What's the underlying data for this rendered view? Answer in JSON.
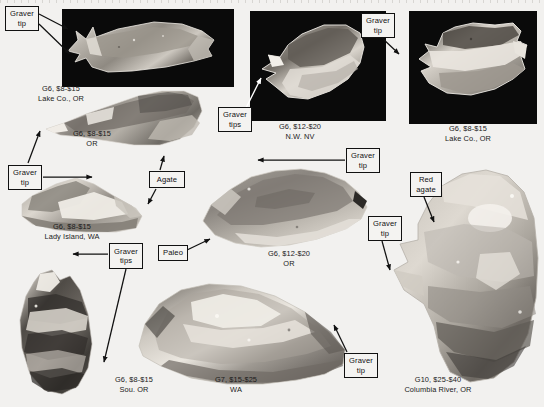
{
  "page": {
    "background": "#f2f1ef",
    "ink": "#111111",
    "plate_background": "#0a0a0a"
  },
  "specimens": [
    {
      "id": "lake-co-or-top",
      "caption": "G6, $8-$15\nLake Co., OR",
      "grade": "G6",
      "price": "$8-$15",
      "locality": "Lake Co., OR"
    },
    {
      "id": "or-second",
      "caption": "G6, $8-$15\nOR",
      "grade": "G6",
      "price": "$8-$15",
      "locality": "OR"
    },
    {
      "id": "nw-nv",
      "caption": "G6, $12-$20\nN.W. NV",
      "grade": "G6",
      "price": "$12-$20",
      "locality": "N.W. NV"
    },
    {
      "id": "lake-co-or-right",
      "caption": "G6, $8-$15\nLake Co., OR",
      "grade": "G6",
      "price": "$8-$15",
      "locality": "Lake Co., OR"
    },
    {
      "id": "lady-island-wa",
      "caption": "G6, $8-$15\nLady Island, WA",
      "grade": "G6",
      "price": "$8-$15",
      "locality": "Lady Island, WA"
    },
    {
      "id": "or-center",
      "caption": "G6, $12-$20\nOR",
      "grade": "G6",
      "price": "$12-$20",
      "locality": "OR"
    },
    {
      "id": "sou-or",
      "caption": "G6, $8-$15\nSou. OR",
      "grade": "G6",
      "price": "$8-$15",
      "locality": "Sou. OR"
    },
    {
      "id": "wa-bottom",
      "caption": "G7, $15-$25\nWA",
      "grade": "G7",
      "price": "$15-$25",
      "locality": "WA"
    },
    {
      "id": "columbia-river-or",
      "caption": "G10, $25-$40\nColumbia River, OR",
      "grade": "G10",
      "price": "$25-$40",
      "locality": "Columbia River, OR"
    }
  ],
  "callouts": [
    {
      "id": "graver-tip-tl",
      "text": "Graver\ntip"
    },
    {
      "id": "graver-tips-midtop",
      "text": "Graver\ntips"
    },
    {
      "id": "graver-tip-topright",
      "text": "Graver\ntip"
    },
    {
      "id": "graver-tip-left",
      "text": "Graver\ntip"
    },
    {
      "id": "agate",
      "text": "Agate"
    },
    {
      "id": "graver-tip-center",
      "text": "Graver\ntip"
    },
    {
      "id": "red-agate",
      "text": "Red\nagate"
    },
    {
      "id": "graver-tip-right",
      "text": "Graver\ntip"
    },
    {
      "id": "graver-tips-bottomleft",
      "text": "Graver\ntips"
    },
    {
      "id": "paleo",
      "text": "Paleo"
    },
    {
      "id": "graver-tip-bottom",
      "text": "Graver\ntip"
    }
  ]
}
